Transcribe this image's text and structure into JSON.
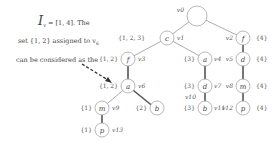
{
  "text": {
    "line1_I": "I",
    "line1_sub": "v",
    "line1_subsub": "0",
    "line1_rest": " = [1, 4]. The",
    "line2": "set {1, 2} assigned to v",
    "line2_sub": "6",
    "line3": "can be considered as the"
  },
  "tree": {
    "nodes": [
      {
        "id": "v0",
        "label": "",
        "vlabel": "v0",
        "set": ""
      },
      {
        "id": "v1",
        "label": "c",
        "vlabel": "v1",
        "set": "{1, 2, 3}"
      },
      {
        "id": "v2",
        "label": "f",
        "vlabel": "v2",
        "set": "{4}"
      },
      {
        "id": "v3",
        "label": "f",
        "vlabel": "v3",
        "set": "{1, 2}"
      },
      {
        "id": "v4",
        "label": "a",
        "vlabel": "v4",
        "set": "{3}"
      },
      {
        "id": "v5",
        "label": "d",
        "vlabel": "v5",
        "set": "{4}"
      },
      {
        "id": "v6",
        "label": "a",
        "vlabel": "v6",
        "set": "{1, 2}"
      },
      {
        "id": "v7",
        "label": "d",
        "vlabel": "v7",
        "set": "{3}"
      },
      {
        "id": "v8",
        "label": "m",
        "vlabel": "v8",
        "set": "{4}"
      },
      {
        "id": "v9",
        "label": "m",
        "vlabel": "v9",
        "set": "{1}"
      },
      {
        "id": "v10",
        "label": "b",
        "vlabel": "v10",
        "set": "{2}"
      },
      {
        "id": "v11",
        "label": "b",
        "vlabel": "v11",
        "set": "{3}"
      },
      {
        "id": "v12",
        "label": "p",
        "vlabel": "v12",
        "set": "{4}"
      },
      {
        "id": "v13",
        "label": "p",
        "vlabel": "v13",
        "set": "{1}"
      }
    ]
  }
}
